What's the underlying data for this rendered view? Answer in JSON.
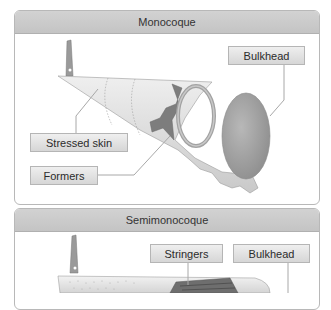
{
  "panels": [
    {
      "title": "Monocoque",
      "labels": {
        "bulkhead": "Bulkhead",
        "stressed_skin": "Stressed skin",
        "formers": "Formers"
      }
    },
    {
      "title": "Semimonocoque",
      "labels": {
        "stringers": "Stringers",
        "bulkhead": "Bulkhead"
      }
    }
  ],
  "colors": {
    "header_bg": "#c8c8c8",
    "label_bg": "#e2e2e2",
    "skin": "#d9d9d9",
    "former": "#8a8a8a",
    "bulkhead": "#9d9d9d",
    "leader_line": "#a8a8a8"
  }
}
